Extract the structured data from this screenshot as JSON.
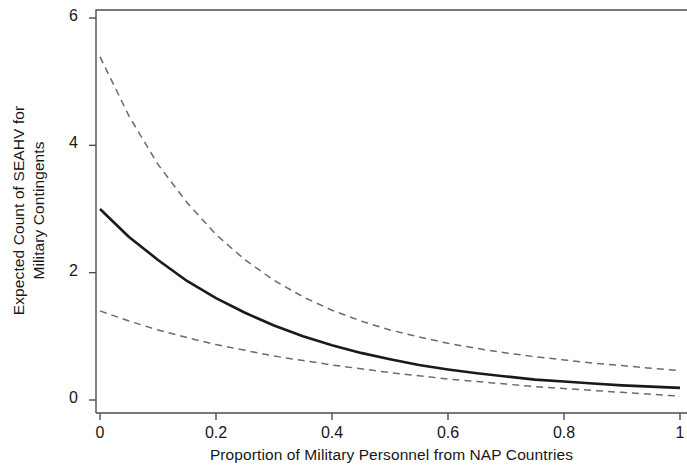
{
  "chart_data": {
    "type": "line",
    "title": "",
    "xlabel": "Proportion of Military Personnel from NAP Countries",
    "ylabel_line1": "Expected Count of SEAHV for",
    "ylabel_line2": "Military Contingents",
    "ylabel": "Expected Count of SEAHV for Military Contingents",
    "xlim": [
      0,
      1
    ],
    "ylim": [
      0,
      6
    ],
    "grid": false,
    "legend": "none",
    "xticks": [
      0,
      0.2,
      0.4,
      0.6,
      0.8,
      1
    ],
    "xtick_labels": [
      "0",
      "0.2",
      "0.4",
      "0.6",
      "0.8",
      "1"
    ],
    "yticks": [
      0,
      2,
      4,
      6
    ],
    "ytick_labels": [
      "0",
      "2",
      "4",
      "6"
    ],
    "x": [
      0,
      0.05,
      0.1,
      0.15,
      0.2,
      0.25,
      0.3,
      0.35,
      0.4,
      0.45,
      0.5,
      0.55,
      0.6,
      0.65,
      0.7,
      0.75,
      0.8,
      0.85,
      0.9,
      0.95,
      1
    ],
    "series": [
      {
        "name": "Expected count (fitted)",
        "style": "solid",
        "color": "#1a1a1a",
        "values": [
          3.0,
          2.56,
          2.2,
          1.87,
          1.6,
          1.37,
          1.17,
          1.0,
          0.86,
          0.74,
          0.64,
          0.55,
          0.48,
          0.42,
          0.37,
          0.32,
          0.29,
          0.26,
          0.23,
          0.21,
          0.19
        ]
      },
      {
        "name": "Upper 95% confidence bound",
        "style": "dashed",
        "color": "#6b6b6b",
        "values": [
          5.39,
          4.46,
          3.7,
          3.1,
          2.6,
          2.2,
          1.88,
          1.62,
          1.41,
          1.24,
          1.1,
          0.99,
          0.89,
          0.81,
          0.74,
          0.68,
          0.63,
          0.58,
          0.54,
          0.5,
          0.46
        ]
      },
      {
        "name": "Lower 95% confidence bound",
        "style": "dashed",
        "color": "#6b6b6b",
        "values": [
          1.4,
          1.24,
          1.1,
          0.98,
          0.87,
          0.78,
          0.69,
          0.62,
          0.55,
          0.49,
          0.43,
          0.38,
          0.33,
          0.29,
          0.25,
          0.21,
          0.18,
          0.15,
          0.12,
          0.09,
          0.06
        ]
      }
    ],
    "axis_color": "#4d4d4d",
    "background": "#ffffff"
  }
}
